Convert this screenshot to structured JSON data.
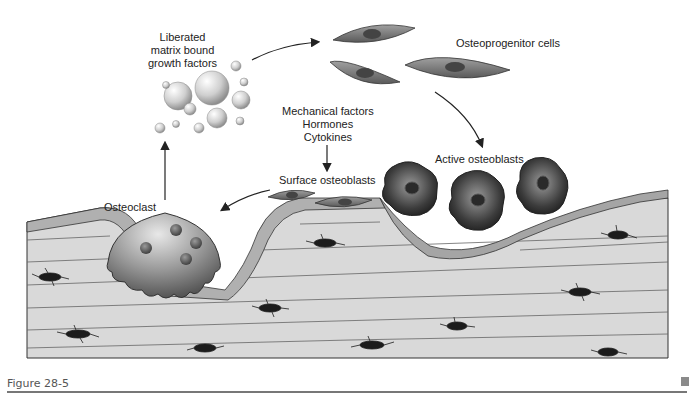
{
  "figure": {
    "caption": "Figure 28-5",
    "labels": {
      "liberated_factors": [
        "Liberated",
        "matrix bound",
        "growth factors"
      ],
      "osteoprogenitor": "Osteoprogenitor cells",
      "regulators": [
        "Mechanical factors",
        "Hormones",
        "Cytokines"
      ],
      "surface_osteoblasts": "Surface osteoblasts",
      "active_osteoblasts": "Active osteoblasts",
      "osteoclast": "Osteoclast"
    },
    "colors": {
      "bone_fill": "#d9d9d9",
      "lining_fill": "#b0b0b0",
      "cell_dark": "#3a3a3a",
      "cell_mid": "#8a8a8a",
      "line": "#333333",
      "caption": "#555555"
    }
  }
}
